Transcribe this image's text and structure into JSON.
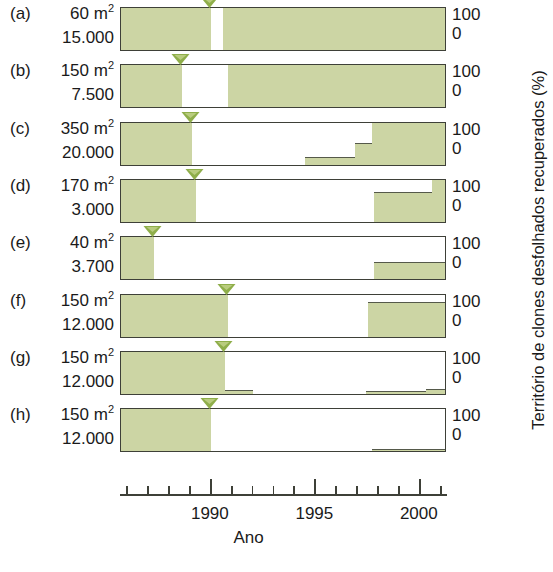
{
  "figure": {
    "x_axis_title": "Ano",
    "y_axis_title": "Território de clones desfolhados recuperados (%)",
    "y_tick_top": "100",
    "y_tick_bottom": "0",
    "x_tick_labels": [
      "1990",
      "1995",
      "2000"
    ],
    "fill_color": "#ccd5a4",
    "outline_color": "#3e4038",
    "marker_color": "#8fae4a"
  },
  "rows": [
    {
      "tag": "(a)",
      "area": "60 m",
      "area_exp": "2",
      "count": "15.000"
    },
    {
      "tag": "(b)",
      "area": "150 m",
      "area_exp": "2",
      "count": "7.500"
    },
    {
      "tag": "(c)",
      "area": "350 m",
      "area_exp": "2",
      "count": "20.000"
    },
    {
      "tag": "(d)",
      "area": "170 m",
      "area_exp": "2",
      "count": "3.000"
    },
    {
      "tag": "(e)",
      "area": "40 m",
      "area_exp": "2",
      "count": "3.700"
    },
    {
      "tag": "(f)",
      "area": "150 m",
      "area_exp": "2",
      "count": "12.000"
    },
    {
      "tag": "(g)",
      "area": "150 m",
      "area_exp": "2",
      "count": "12.000"
    },
    {
      "tag": "(h)",
      "area": "150 m",
      "area_exp": "2",
      "count": "12.000"
    }
  ],
  "chart_data": {
    "type": "area",
    "title": "",
    "xlabel": "Ano",
    "ylabel": "Território de clones desfolhados recuperados (%)",
    "xlim": [
      1985.7,
      2001.3
    ],
    "ylim": [
      0,
      100
    ],
    "x_ticks_major": [
      1990,
      1995,
      2000
    ],
    "x_ticks_minor": [
      1986,
      1987,
      1988,
      1989,
      1991,
      1992,
      1993,
      1994,
      1996,
      1997,
      1998,
      1999,
      2001
    ],
    "grid": false,
    "legend": "none",
    "panels": [
      {
        "label": "(a)",
        "area_m2": 60,
        "colony_size": 15000,
        "defoliation_marker_year": 1990.0,
        "steps": [
          {
            "x_start": 1985.7,
            "x_end": 1990.0,
            "value": 100
          },
          {
            "x_start": 1990.0,
            "x_end": 1990.6,
            "value": 0
          },
          {
            "x_start": 1990.6,
            "x_end": 2001.3,
            "value": 100
          }
        ]
      },
      {
        "label": "(b)",
        "area_m2": 150,
        "colony_size": 7500,
        "defoliation_marker_year": 1988.6,
        "steps": [
          {
            "x_start": 1985.7,
            "x_end": 1988.6,
            "value": 100
          },
          {
            "x_start": 1988.6,
            "x_end": 1990.8,
            "value": 0
          },
          {
            "x_start": 1990.8,
            "x_end": 2001.3,
            "value": 100
          }
        ]
      },
      {
        "label": "(c)",
        "area_m2": 350,
        "colony_size": 20000,
        "defoliation_marker_year": 1989.1,
        "steps": [
          {
            "x_start": 1985.7,
            "x_end": 1989.1,
            "value": 100
          },
          {
            "x_start": 1989.1,
            "x_end": 1994.5,
            "value": 0
          },
          {
            "x_start": 1994.5,
            "x_end": 1996.9,
            "value": 18
          },
          {
            "x_start": 1996.9,
            "x_end": 1997.7,
            "value": 48
          },
          {
            "x_start": 1997.7,
            "x_end": 2001.3,
            "value": 100
          }
        ]
      },
      {
        "label": "(d)",
        "area_m2": 170,
        "colony_size": 3000,
        "defoliation_marker_year": 1989.3,
        "steps": [
          {
            "x_start": 1985.7,
            "x_end": 1989.3,
            "value": 100
          },
          {
            "x_start": 1989.3,
            "x_end": 1997.8,
            "value": 0
          },
          {
            "x_start": 1997.8,
            "x_end": 2000.6,
            "value": 68
          },
          {
            "x_start": 2000.6,
            "x_end": 2001.3,
            "value": 100
          }
        ]
      },
      {
        "label": "(e)",
        "area_m2": 40,
        "colony_size": 3700,
        "defoliation_marker_year": 1987.3,
        "steps": [
          {
            "x_start": 1985.7,
            "x_end": 1987.3,
            "value": 100
          },
          {
            "x_start": 1987.3,
            "x_end": 1997.8,
            "value": 0
          },
          {
            "x_start": 1997.8,
            "x_end": 2001.3,
            "value": 40
          }
        ]
      },
      {
        "label": "(f)",
        "area_m2": 150,
        "colony_size": 12000,
        "defoliation_marker_year": 1990.8,
        "steps": [
          {
            "x_start": 1985.7,
            "x_end": 1990.8,
            "value": 100
          },
          {
            "x_start": 1990.8,
            "x_end": 1997.5,
            "value": 0
          },
          {
            "x_start": 1997.5,
            "x_end": 2001.3,
            "value": 78
          }
        ]
      },
      {
        "label": "(g)",
        "area_m2": 150,
        "colony_size": 12000,
        "defoliation_marker_year": 1990.7,
        "steps": [
          {
            "x_start": 1985.7,
            "x_end": 1990.7,
            "value": 100
          },
          {
            "x_start": 1990.7,
            "x_end": 1992.0,
            "value": 8
          },
          {
            "x_start": 1992.0,
            "x_end": 1997.4,
            "value": 0
          },
          {
            "x_start": 1997.4,
            "x_end": 2000.3,
            "value": 7
          },
          {
            "x_start": 2000.3,
            "x_end": 2001.3,
            "value": 12
          }
        ]
      },
      {
        "label": "(h)",
        "area_m2": 150,
        "colony_size": 12000,
        "defoliation_marker_year": 1990.0,
        "steps": [
          {
            "x_start": 1985.7,
            "x_end": 1990.0,
            "value": 100
          },
          {
            "x_start": 1990.0,
            "x_end": 1997.7,
            "value": 0
          },
          {
            "x_start": 1997.7,
            "x_end": 2001.3,
            "value": 5
          }
        ]
      }
    ]
  }
}
